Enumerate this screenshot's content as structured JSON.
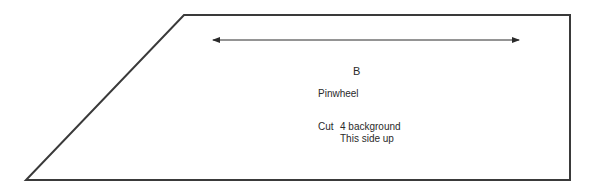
{
  "pattern_piece": {
    "letter": "B",
    "name": "Pinwheel",
    "cut_label": "Cut",
    "cut_instruction": "4 background",
    "orientation_note": "This side up",
    "grainline": "double-headed-arrow",
    "outline_color": "#3a3a3a",
    "shape": "trapezoid"
  }
}
